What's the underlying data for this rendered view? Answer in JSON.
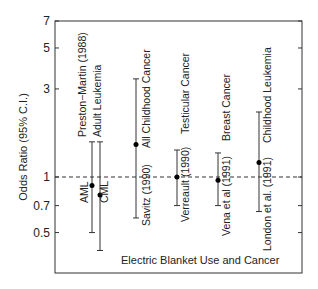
{
  "chart_data": {
    "type": "scatter",
    "subtype": "forest-plot-errorbars",
    "title": "Electric Blanket Use and Cancer",
    "xlabel": "",
    "ylabel": "Odds Ratio (95% C.I.)",
    "yscale": "log",
    "ylim": [
      0.3,
      7
    ],
    "yticks": [
      0.5,
      0.7,
      1,
      3,
      5,
      7
    ],
    "ytick_labels": [
      "0.5",
      "0.7",
      "1",
      "3",
      "5",
      "7"
    ],
    "reference_line": {
      "y": 1,
      "style": "dashed"
    },
    "grid": false,
    "legend": null,
    "groups": [
      {
        "label": "Preston−Martin (1988)",
        "sublabel": "Adult Leukemia",
        "label_x": 82,
        "sublabel_x": 100
      }
    ],
    "studies": [
      {
        "label": "AML",
        "x": 92,
        "or": 0.9,
        "ci_low": 0.5,
        "ci_high": 1.55,
        "label_pos": "left-below"
      },
      {
        "label": "CML",
        "x": 100,
        "or": 0.8,
        "ci_low": 0.4,
        "ci_high": 1.55,
        "label_pos": "right-below"
      },
      {
        "label": "Savitz (1990)  All Childhood Cancer",
        "x": 136,
        "or": 1.5,
        "ci_low": 0.6,
        "ci_high": 3.4
      },
      {
        "label": "Verreault (1990)  Testicular Cancer",
        "x": 177,
        "or": 1.0,
        "ci_low": 0.7,
        "ci_high": 1.4
      },
      {
        "label": "Vena et al (1991)  Breast Cancer",
        "x": 218,
        "or": 0.96,
        "ci_low": 0.7,
        "ci_high": 1.35
      },
      {
        "label": "London et al. (1991)  Childhood Leukemia",
        "x": 259,
        "or": 1.2,
        "ci_low": 0.65,
        "ci_high": 2.25
      }
    ]
  },
  "labels": {
    "title": "Electric Blanket Use and Cancer",
    "ylabel": "Odds Ratio (95% C.I.)",
    "preston": "Preston−Martin (1988)",
    "adult_leukemia": "Adult Leukemia",
    "aml": "AML",
    "cml": "CML",
    "savitz": "Savitz (1990)",
    "savitz_cancer": "All Childhood Cancer",
    "verreault": "Verreault (1990)",
    "verreault_cancer": "Testicular Cancer",
    "vena": "Vena et al (1991)",
    "vena_cancer": "Breast Cancer",
    "london": "London et al. (1991)",
    "london_cancer": "Childhood Leukemia"
  },
  "colors": {
    "axis": "#333333",
    "text": "#222222",
    "point": "#000000",
    "errorbar": "#333333",
    "reference": "#333333"
  }
}
